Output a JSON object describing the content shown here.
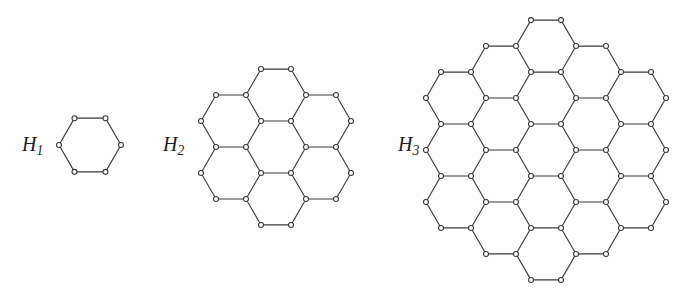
{
  "figure": {
    "caption": "",
    "background_color": "#fefefe",
    "line_color": "#3a3a42",
    "vertex_fill_color": "#fdfdfd",
    "vertex_stroke_color": "#35353d",
    "label_color": "#1c1c22",
    "width": 687,
    "height": 295
  },
  "panels": [
    {
      "id": "H1",
      "label_base": "H",
      "label_subscript": "1",
      "label_text": "H1",
      "generation": 1,
      "hexagon_count": 1,
      "vertex_count": 6,
      "edge_count": 6,
      "rings": 0,
      "columns": [
        1
      ],
      "label_x": 22,
      "label_y": 133,
      "label_font_size": 20,
      "center_x": 90,
      "center_y": 145,
      "circumradius": 31,
      "orientation": "flat-top"
    },
    {
      "id": "H2",
      "label_base": "H",
      "label_subscript": "2",
      "label_text": "H2",
      "generation": 2,
      "hexagon_count": 7,
      "vertex_count": 30,
      "edge_count": 36,
      "rings": 1,
      "columns": [
        2,
        3,
        2
      ],
      "label_x": 163,
      "label_y": 133,
      "label_font_size": 20,
      "center_x": 276,
      "center_y": 147,
      "circumradius": 30,
      "orientation": "flat-top"
    },
    {
      "id": "H3",
      "label_base": "H",
      "label_subscript": "3",
      "label_text": "H3",
      "generation": 3,
      "hexagon_count": 19,
      "vertex_count": 66,
      "edge_count": 84,
      "rings": 2,
      "columns": [
        3,
        4,
        5,
        4,
        3
      ],
      "label_x": 398,
      "label_y": 133,
      "label_font_size": 20,
      "center_x": 546,
      "center_y": 150,
      "circumradius": 30,
      "orientation": "flat-top"
    }
  ],
  "chart_data": {
    "type": "diagram",
    "title": "",
    "series": [
      {
        "name": "H1",
        "hexagons": 1,
        "vertices": 6
      },
      {
        "name": "H2",
        "hexagons": 7,
        "vertices": 30
      },
      {
        "name": "H3",
        "hexagons": 19,
        "vertices": 66
      }
    ]
  }
}
